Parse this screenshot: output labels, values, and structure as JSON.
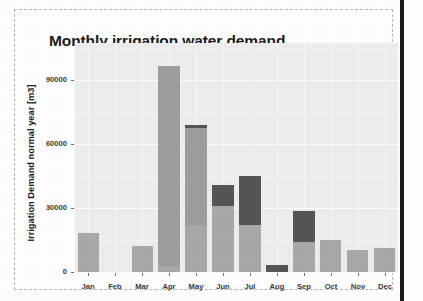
{
  "chart_data": {
    "type": "bar",
    "title": "Monthly irrigation water demand",
    "xlabel": "",
    "ylabel": "Irrigation Demand normal year [m3]",
    "categories": [
      "Jan",
      "Feb",
      "Mar",
      "Apr",
      "May",
      "Jun",
      "Jul",
      "Aug",
      "Sep",
      "Oct",
      "Nov",
      "Dec"
    ],
    "ylim": [
      0,
      108000
    ],
    "yticks": [
      0,
      30000,
      60000,
      90000
    ],
    "ytick_labels": [
      "0",
      "30000",
      "60000",
      "90000"
    ],
    "grid": true,
    "legend": "none",
    "stacked": true,
    "series": [
      {
        "name": "lower-segment",
        "color": "#a8a8a8",
        "values": [
          18500,
          0,
          12500,
          3000,
          22000,
          31000,
          22000,
          0,
          14000,
          15000,
          10500,
          11500
        ]
      },
      {
        "name": "middle-segment",
        "color": "#9d9d9d",
        "values": [
          0,
          0,
          0,
          94000,
          46000,
          0,
          0,
          0,
          0,
          0,
          0,
          0
        ]
      },
      {
        "name": "upper-segment",
        "color": "#555556",
        "values": [
          0,
          0,
          0,
          0,
          1500,
          10000,
          23500,
          3500,
          15000,
          0,
          0,
          0
        ]
      }
    ],
    "totals": [
      18500,
      0,
      12500,
      97000,
      69500,
      41000,
      45500,
      3500,
      29000,
      15000,
      10500,
      11500
    ],
    "note_clipped_bars": [
      "Apr"
    ]
  },
  "figure": {
    "panel_border_style": "dashed",
    "plot_background": "#ececed",
    "page_background": "#fdfdfd"
  }
}
